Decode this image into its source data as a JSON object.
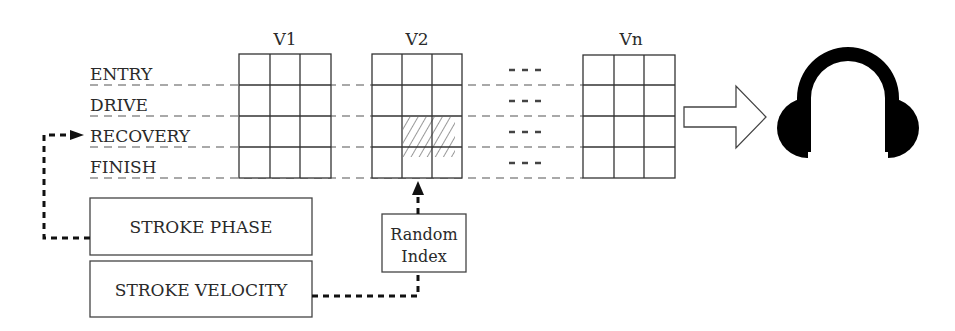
{
  "diagram": {
    "phases": [
      "ENTRY",
      "DRIVE",
      "RECOVERY",
      "FINISH"
    ],
    "tables": [
      {
        "label": "V1"
      },
      {
        "label": "V2",
        "highlight": {
          "row": 2,
          "cols": [
            1,
            2
          ],
          "rows_span": [
            2,
            3
          ]
        }
      },
      {
        "label": "Vn"
      }
    ],
    "ellipsis": "- - -",
    "inputs": {
      "stroke_phase": "STROKE PHASE",
      "stroke_velocity": "STROKE VELOCITY"
    },
    "random_index": {
      "line1": "Random",
      "line2": "Index"
    },
    "output_icon": "headphones-icon",
    "colors": {
      "line": "#3a3a3a",
      "fill": "#000000",
      "background": "#ffffff"
    }
  }
}
